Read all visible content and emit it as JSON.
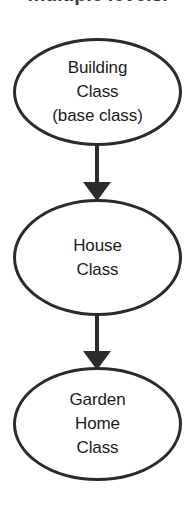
{
  "diagram": {
    "caption": "multiple levels.",
    "nodes": [
      {
        "id": "building-class",
        "label": "Building\nClass\n(base class)"
      },
      {
        "id": "house-class",
        "label": "House\nClass"
      },
      {
        "id": "garden-home-class",
        "label": "Garden\nHome\nClass"
      }
    ],
    "arrows": [
      {
        "id": "arrow-building-to-house",
        "from": "building-class",
        "to": "house-class",
        "direction": "down"
      },
      {
        "id": "arrow-house-to-garden-home",
        "from": "house-class",
        "to": "garden-home-class",
        "direction": "down"
      }
    ],
    "colors": {
      "stroke": "#2b2b2b",
      "fill": "#ffffff",
      "text": "#1a1a1a",
      "caption": "#3a3a3a"
    }
  }
}
